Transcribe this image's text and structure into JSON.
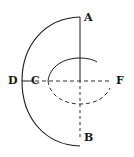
{
  "figure": {
    "stroke_color": "#1a1a1a",
    "background": "#ffffff"
  },
  "labels": {
    "A": "A",
    "B": "B",
    "C": "C",
    "D": "D",
    "F": "F"
  }
}
